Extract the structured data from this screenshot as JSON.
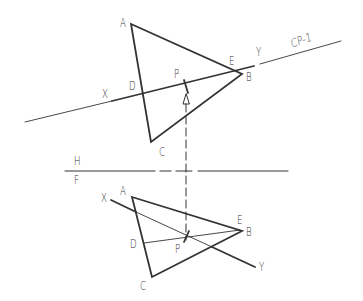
{
  "diagram": {
    "colors": {
      "line": "#333333",
      "background": "#ffffff"
    },
    "fold_line": {
      "upper_label": "H",
      "lower_label": "F"
    },
    "top_view": {
      "cutting_plane_label": "CP-1",
      "labels": {
        "A": "A",
        "B": "B",
        "C": "C",
        "D": "D",
        "E": "E",
        "P": "P",
        "X": "X",
        "Y": "Y"
      }
    },
    "front_view": {
      "labels": {
        "A": "A",
        "B": "B",
        "C": "C",
        "D": "D",
        "E": "E",
        "P": "P",
        "X": "X",
        "Y": "Y"
      }
    }
  }
}
